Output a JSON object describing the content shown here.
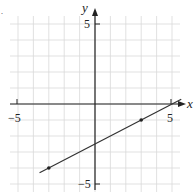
{
  "chart_data": {
    "type": "line",
    "title": "",
    "xlabel": "x",
    "ylabel": "y",
    "xlim": [
      -5,
      5
    ],
    "ylim": [
      -5,
      5
    ],
    "grid": true,
    "tick_labels": {
      "x_min": "-5",
      "x_max": "5",
      "y_min": "-5",
      "y_max": "5"
    },
    "series": [
      {
        "name": "line",
        "equation": "y = 0.5x - 2.5",
        "x": [
          -3.6,
          5.6
        ],
        "y": [
          -4.3,
          0.3
        ]
      }
    ],
    "points": [
      {
        "x": -3,
        "y": -4
      },
      {
        "x": 3,
        "y": -1
      }
    ],
    "colors": {
      "grid": "#d9d9d9",
      "axis": "#222222",
      "line": "#333333"
    }
  },
  "labels": {
    "x_axis": "x",
    "y_axis": "y",
    "x_neg": "−5",
    "x_pos": "5",
    "y_pos": "5",
    "y_neg": "−5"
  }
}
